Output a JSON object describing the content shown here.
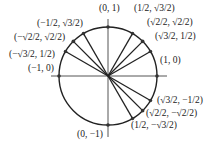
{
  "diagram": {
    "center": [
      108,
      76
    ],
    "radius": 49,
    "points": [
      {
        "label": "(0, 1)",
        "angle": 90,
        "x": 99,
        "y": 4,
        "ray": false
      },
      {
        "label": "(1/2, √3/2)",
        "angle": 60,
        "x": 134,
        "y": 4,
        "ray": true
      },
      {
        "label": "(√2/2, √2/2)",
        "angle": 45,
        "x": 147,
        "y": 18,
        "ray": true
      },
      {
        "label": "(√3/2, 1/2)",
        "angle": 30,
        "x": 155,
        "y": 32,
        "ray": true
      },
      {
        "label": "(1, 0)",
        "angle": 0,
        "x": 160,
        "y": 56,
        "ray": false
      },
      {
        "label": "(√3/2, −1/2)",
        "angle": -30,
        "x": 157,
        "y": 96,
        "ray": true
      },
      {
        "label": "(√2/2, −√2/2)",
        "angle": -45,
        "x": 146,
        "y": 109,
        "ray": true
      },
      {
        "label": "(1/2, −√3/2)",
        "angle": -60,
        "x": 131,
        "y": 121,
        "ray": true
      },
      {
        "label": "(0, −1)",
        "angle": -90,
        "x": 77,
        "y": 130,
        "ray": false
      },
      {
        "label": "(−1, 0)",
        "angle": 180,
        "x": 28,
        "y": 64,
        "ray": false
      },
      {
        "label": "(−√3/2, 1/2)",
        "angle": 150,
        "x": 9,
        "y": 50,
        "ray": true
      },
      {
        "label": "(−√2/2, √2/2)",
        "angle": 135,
        "x": 14,
        "y": 33,
        "ray": true
      },
      {
        "label": "(−1/2, √3/2)",
        "angle": 120,
        "x": 37,
        "y": 19,
        "ray": true
      }
    ]
  }
}
